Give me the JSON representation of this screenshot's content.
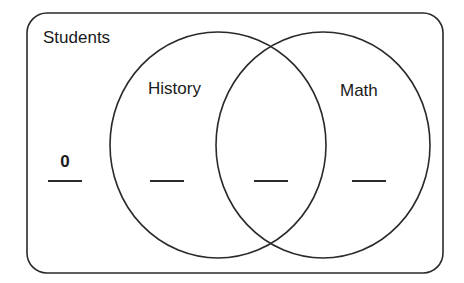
{
  "diagram": {
    "type": "venn",
    "universe": {
      "label": "Students"
    },
    "sets": [
      {
        "id": "history",
        "label": "History"
      },
      {
        "id": "math",
        "label": "Math"
      }
    ],
    "regions": [
      {
        "id": "outside",
        "description": "Students in neither set",
        "value": "0"
      },
      {
        "id": "history_only",
        "description": "History only",
        "value": ""
      },
      {
        "id": "both",
        "description": "History and Math",
        "value": ""
      },
      {
        "id": "math_only",
        "description": "Math only",
        "value": ""
      }
    ]
  },
  "colors": {
    "stroke": "#2a2a2a",
    "background": "#ffffff",
    "text": "#1a1a1a"
  }
}
